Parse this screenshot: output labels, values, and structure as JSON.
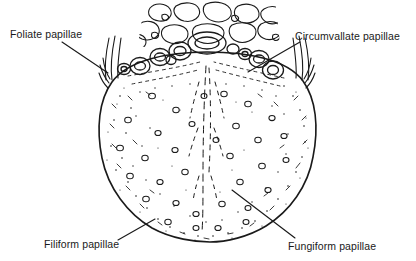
{
  "figure": {
    "background_color": "#ffffff",
    "ink_color": "#1a1a1a",
    "width": 416,
    "height": 261
  },
  "labels": [
    {
      "id": "foliate",
      "text": "Foliate papillae",
      "position": "upper-left",
      "leader_from": [
        62,
        42
      ],
      "leader_to": [
        108,
        73
      ]
    },
    {
      "id": "circumvallate",
      "text": "Circumvallate papillae",
      "position": "upper-right",
      "leader_from": [
        300,
        42
      ],
      "leader_to": [
        248,
        72
      ]
    },
    {
      "id": "filiform",
      "text": "Filiform papillae",
      "position": "lower-left",
      "leader_from": [
        118,
        240
      ],
      "leader_to": [
        155,
        219
      ]
    },
    {
      "id": "fungiform",
      "text": "Fungiform papillae",
      "position": "lower-right",
      "leader_from": [
        232,
        190
      ],
      "leader_to": [
        295,
        238
      ]
    }
  ],
  "structures": {
    "lingual_tonsil": "irregular cobblestone nodules across the tongue root at top",
    "terminal_sulcus": "V-shaped row of circumvallate papillae",
    "median_sulcus": "dashed midline groove running from terminal sulcus to apex",
    "tongue_body": "oval dorsum stippled with filiform papillae and scattered round fungiform papillae",
    "foliate_ridges": "vertical parallel folds on the posterior lateral margins"
  }
}
